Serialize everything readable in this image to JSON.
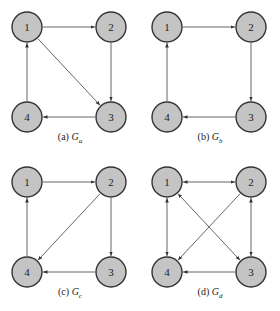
{
  "style": {
    "node_fill": "#c4c4c4",
    "node_stroke": "#333333",
    "edge_color": "#555555",
    "node_radius": 15
  },
  "node_positions": {
    "1": [
      27,
      27
    ],
    "2": [
      111,
      27
    ],
    "3": [
      111,
      117
    ],
    "4": [
      27,
      117
    ]
  },
  "graphs": [
    {
      "id": "a",
      "caption_prefix": "(a)",
      "caption_symbol": "G",
      "caption_sub": "a",
      "offset": [
        0,
        0
      ],
      "nodes": [
        "1",
        "2",
        "3",
        "4"
      ],
      "edges": [
        {
          "from": "1",
          "to": "2",
          "bidirectional": false
        },
        {
          "from": "2",
          "to": "3",
          "bidirectional": false
        },
        {
          "from": "1",
          "to": "3",
          "bidirectional": false
        },
        {
          "from": "3",
          "to": "4",
          "bidirectional": false
        },
        {
          "from": "4",
          "to": "1",
          "bidirectional": false
        }
      ]
    },
    {
      "id": "b",
      "caption_prefix": "(b)",
      "caption_symbol": "G",
      "caption_sub": "b",
      "offset": [
        140,
        0
      ],
      "nodes": [
        "1",
        "2",
        "3",
        "4"
      ],
      "edges": [
        {
          "from": "1",
          "to": "2",
          "bidirectional": false
        },
        {
          "from": "2",
          "to": "3",
          "bidirectional": false
        },
        {
          "from": "3",
          "to": "4",
          "bidirectional": false
        },
        {
          "from": "4",
          "to": "1",
          "bidirectional": false
        }
      ]
    },
    {
      "id": "c",
      "caption_prefix": "(c)",
      "caption_symbol": "G",
      "caption_sub": "c",
      "offset": [
        0,
        155
      ],
      "nodes": [
        "1",
        "2",
        "3",
        "4"
      ],
      "edges": [
        {
          "from": "1",
          "to": "2",
          "bidirectional": false
        },
        {
          "from": "2",
          "to": "3",
          "bidirectional": false
        },
        {
          "from": "2",
          "to": "4",
          "bidirectional": false
        },
        {
          "from": "3",
          "to": "4",
          "bidirectional": false
        },
        {
          "from": "4",
          "to": "1",
          "bidirectional": false
        }
      ]
    },
    {
      "id": "d",
      "caption_prefix": "(d)",
      "caption_symbol": "G",
      "caption_sub": "d",
      "offset": [
        140,
        155
      ],
      "nodes": [
        "1",
        "2",
        "3",
        "4"
      ],
      "edges": [
        {
          "from": "1",
          "to": "2",
          "bidirectional": true
        },
        {
          "from": "1",
          "to": "4",
          "bidirectional": true
        },
        {
          "from": "1",
          "to": "3",
          "bidirectional": true
        },
        {
          "from": "2",
          "to": "3",
          "bidirectional": true
        },
        {
          "from": "2",
          "to": "4",
          "bidirectional": false
        },
        {
          "from": "3",
          "to": "4",
          "bidirectional": false
        }
      ]
    }
  ]
}
